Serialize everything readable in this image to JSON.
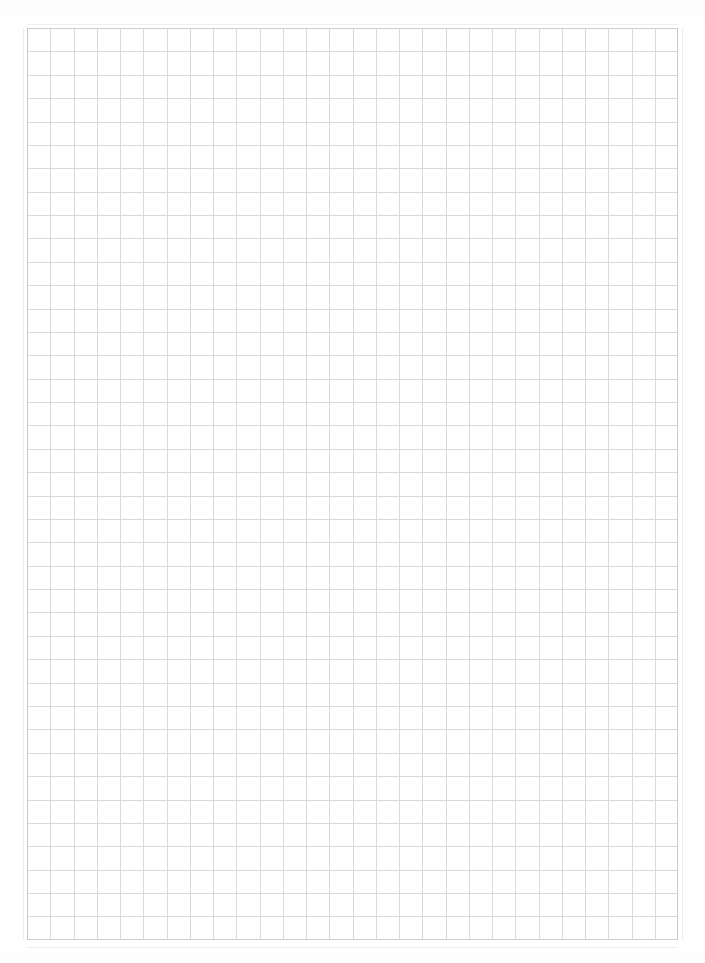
{
  "document": {
    "kind": "scanned-grid-paper",
    "title": "Blank grid paper sheet",
    "text_content": "",
    "annotations": "",
    "page_number": "",
    "canvas": {
      "width": 705,
      "height": 963
    },
    "background_color": "#ffffff"
  },
  "grid": {
    "label": "grid-paper-ruling",
    "origin_x": 27,
    "origin_y": 28,
    "width": 651,
    "height": 912,
    "columns": 28,
    "rows": 39,
    "cell_width": 23.25,
    "cell_height": 23.38,
    "line_color": "#d7dadc",
    "line_width": 1,
    "border_color": "#c9ccce",
    "ghost_line_color": "#ededef"
  },
  "artifacts": {
    "top_ghost_rule_y": 24,
    "bottom_ghost_rule_y": 947,
    "left_ghost_rule_x": 23,
    "right_ghost_rule_x": 682
  }
}
